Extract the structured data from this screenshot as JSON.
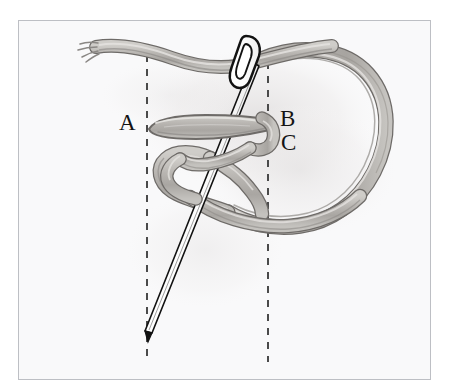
{
  "figure": {
    "kind": "embroidery-stitch-illustration",
    "background_color": "#f9f9fa",
    "frame_border_color": "#bdbfc4",
    "page_background": "#ffffff"
  },
  "labels": [
    {
      "id": "A",
      "text": "A",
      "x": 128,
      "y": 123,
      "meaning": "thread-entry-point-left"
    },
    {
      "id": "B",
      "text": "B",
      "x": 289,
      "y": 119,
      "meaning": "thread-point-right-upper"
    },
    {
      "id": "C",
      "text": "C",
      "x": 290,
      "y": 143,
      "meaning": "thread-point-right-lower"
    }
  ],
  "guides": {
    "style": "dashed",
    "color": "#4a4a4a",
    "dash": "7 7",
    "width": 2,
    "lines": [
      {
        "name": "guide-line-left",
        "x": 147,
        "y_top": 55,
        "y_bottom": 362
      },
      {
        "name": "guide-line-right",
        "x": 268,
        "y_top": 62,
        "y_bottom": 362
      }
    ]
  },
  "needle": {
    "name": "sewing-needle",
    "outline_color": "#121212",
    "body_color": "#fdfdfd",
    "eye_center": {
      "x": 247,
      "y": 52
    },
    "tip": {
      "x": 146,
      "y": 332
    },
    "angle_note": "shaft tilts down-left from eye at top to point at bottom-left"
  },
  "thread": {
    "name": "embroidery-thread",
    "fill_color": "#b9b6b2",
    "fill_light": "#d2d0cd",
    "outline_color": "#6e6b68",
    "highlight_color": "#e6e4e1",
    "segments": [
      {
        "name": "thread-tail-top-left",
        "note": "frayed end entering from upper left near x=95,y=48"
      },
      {
        "name": "thread-horizontal-A-to-B",
        "note": "tapered bar from A (x=147,y=127) to B (x=268,y=124)"
      },
      {
        "name": "thread-loop-right-large",
        "note": "large loop sweeping right from top thread down around to bottom"
      },
      {
        "name": "thread-loop-lower-left",
        "note": "small loop curling at lower left crossing needle shaft"
      }
    ]
  },
  "shadow": {
    "name": "drop-shadow",
    "color": "#eceaea",
    "note": "soft gray wash behind thread to the right side"
  }
}
